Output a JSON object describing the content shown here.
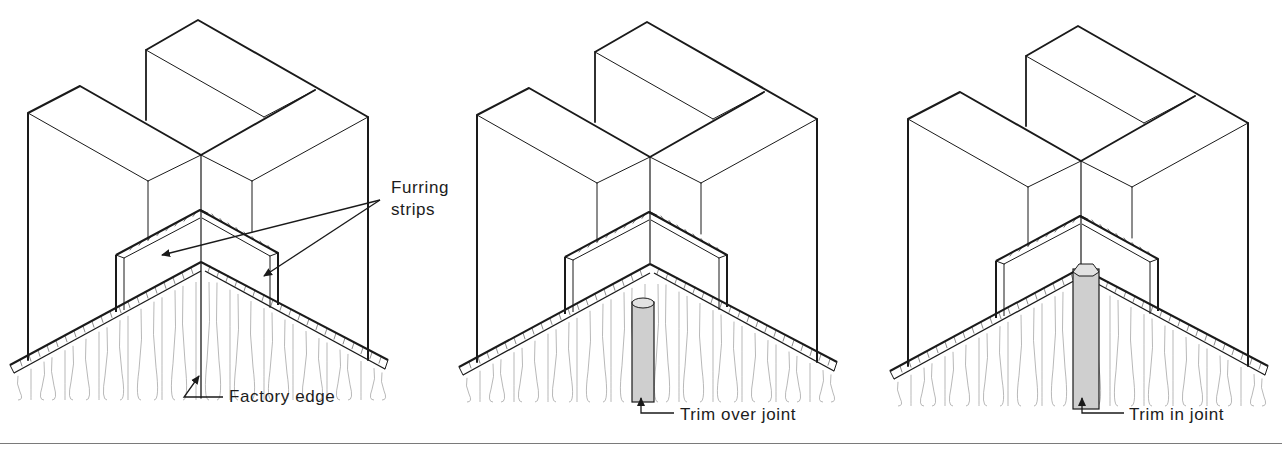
{
  "figure": {
    "panels": [
      {
        "id": "factory-edge",
        "offset_x": 0,
        "offset_y": 0,
        "trim": "none",
        "callout_label": "Factory edge",
        "callout_label_pos": [
          228,
          397
        ]
      },
      {
        "id": "trim-over-joint",
        "offset_x": 449,
        "offset_y": 2,
        "trim": "over",
        "callout_label": "Trim over joint",
        "callout_label_pos": [
          679,
          412
        ]
      },
      {
        "id": "trim-in-joint",
        "offset_x": 880,
        "offset_y": 6,
        "trim": "in",
        "callout_label": "Trim in joint",
        "callout_label_pos": [
          1128,
          412
        ]
      }
    ],
    "furring_label": [
      "Furring",
      "strips"
    ],
    "furring_label_pos": [
      391,
      186
    ],
    "colors": {
      "line": "#1a1a1a",
      "grain": "#9a9a9a",
      "trim_fill": "#cfcfcf",
      "rule": "#7a7a7a"
    }
  }
}
